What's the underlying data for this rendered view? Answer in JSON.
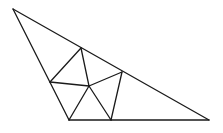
{
  "diagram": {
    "type": "triangle-dissection",
    "stroke_color": "#1a1a1a",
    "background": "#ffffff",
    "vertices": {
      "A": {
        "x": 13,
        "y": 9,
        "role": "top-vertex"
      },
      "B": {
        "x": 69,
        "y": 120,
        "role": "bottom-left-vertex"
      },
      "C": {
        "x": 209,
        "y": 120,
        "role": "right-vertex"
      },
      "P": {
        "x": 50,
        "y": 82,
        "role": "point-on-AB"
      },
      "Q": {
        "x": 81,
        "y": 48,
        "role": "point-on-AC"
      },
      "R": {
        "x": 122,
        "y": 72,
        "role": "point-on-AC"
      },
      "S": {
        "x": 111,
        "y": 120,
        "role": "point-on-BC"
      },
      "O": {
        "x": 89,
        "y": 86,
        "role": "interior-point"
      }
    },
    "edges": [
      [
        "A",
        "B"
      ],
      [
        "B",
        "C"
      ],
      [
        "C",
        "A"
      ],
      [
        "P",
        "Q"
      ],
      [
        "Q",
        "O"
      ],
      [
        "P",
        "O"
      ],
      [
        "O",
        "R"
      ],
      [
        "R",
        "S"
      ],
      [
        "O",
        "S"
      ],
      [
        "O",
        "B"
      ]
    ]
  }
}
